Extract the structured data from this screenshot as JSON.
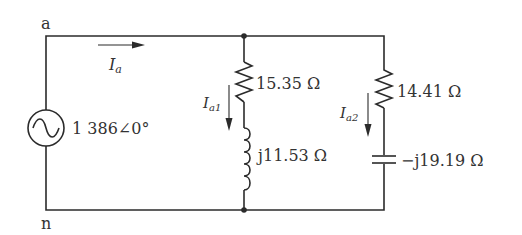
{
  "diagram": {
    "type": "circuit",
    "nodes": {
      "top": "a",
      "bottom": "n"
    },
    "source": {
      "symbol": "ac-voltage-source",
      "value": "1 386∠0°"
    },
    "line_current": {
      "label": "I",
      "subscript": "a"
    },
    "branch1": {
      "current": {
        "label": "I",
        "subscript": "a1"
      },
      "resistor": "15.35 Ω",
      "inductor": "j11.53 Ω"
    },
    "branch2": {
      "current": {
        "label": "I",
        "subscript": "a2"
      },
      "resistor": "14.41 Ω",
      "capacitor": "−j19.19 Ω"
    },
    "colors": {
      "line": "#2b2b2b",
      "text": "#333333",
      "background": "#ffffff"
    }
  }
}
